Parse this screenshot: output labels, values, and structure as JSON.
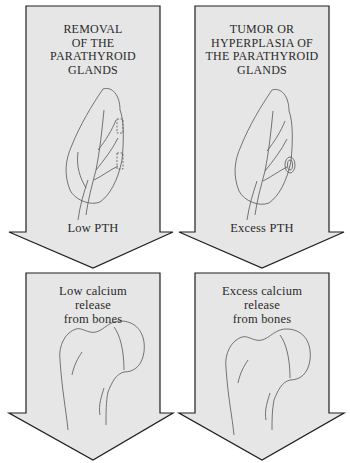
{
  "colors": {
    "arrow_fill": "#e6e6e6",
    "arrow_stroke": "#1e1e1e",
    "drawing_stroke": "#555555",
    "background": "#ffffff"
  },
  "left_column": {
    "top_arrow": {
      "title_lines": [
        "REMOVAL",
        "OF THE",
        "PARATHYROID",
        "GLANDS"
      ],
      "illustration": "thyroid-with-removed-parathyroid-glands",
      "result": "Low PTH"
    },
    "bottom_arrow": {
      "title_lines": [
        "Low calcium",
        "release",
        "from bones"
      ],
      "illustration": "femur-head"
    }
  },
  "right_column": {
    "top_arrow": {
      "title_lines": [
        "TUMOR OR",
        "HYPERPLASIA OF",
        "THE PARATHYROID",
        "GLANDS"
      ],
      "illustration": "thyroid-with-enlarged-parathyroid-gland",
      "result": "Excess PTH"
    },
    "bottom_arrow": {
      "title_lines": [
        "Excess calcium",
        "release",
        "from bones"
      ],
      "illustration": "femur-head"
    }
  }
}
